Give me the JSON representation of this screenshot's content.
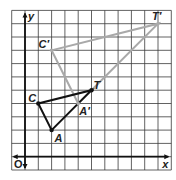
{
  "diagram": {
    "type": "coordinate-grid-dilation",
    "grid": {
      "xmin": -1,
      "xmax": 11,
      "ymin": -1,
      "ymax": 11,
      "cell_px": 13.3,
      "origin_px": [
        25,
        156.7
      ]
    },
    "axes": {
      "x_label": "x",
      "y_label": "y",
      "origin_label": "O"
    },
    "colors": {
      "grid": "#3a3a3a",
      "original": "#111111",
      "image": "#a9a9a9",
      "background": "#ffffff"
    },
    "original_triangle": {
      "points": [
        {
          "name": "C",
          "label": "C",
          "x": 1,
          "y": 4
        },
        {
          "name": "A",
          "label": "A",
          "x": 2,
          "y": 2
        },
        {
          "name": "T",
          "label": "T",
          "x": 5,
          "y": 5
        }
      ]
    },
    "image_triangle": {
      "points": [
        {
          "name": "C-prime",
          "label": "C′",
          "x": 2,
          "y": 8
        },
        {
          "name": "A-prime",
          "label": "A′",
          "x": 4,
          "y": 4
        },
        {
          "name": "T-prime",
          "label": "T′",
          "x": 10,
          "y": 10
        }
      ]
    }
  }
}
